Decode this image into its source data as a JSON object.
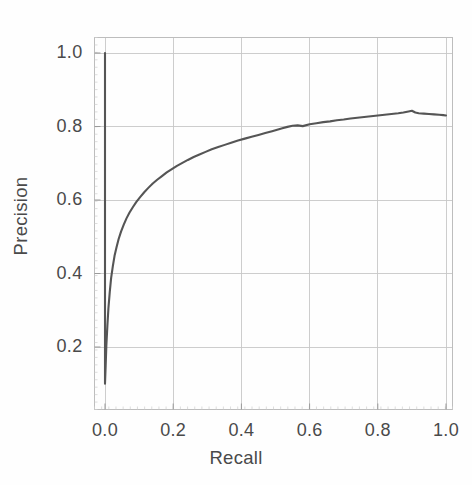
{
  "chart_data": {
    "type": "line",
    "title": "",
    "xlabel": "Recall",
    "ylabel": "Precision",
    "xlim": [
      0.0,
      1.0
    ],
    "ylim": [
      0.0,
      1.08
    ],
    "grid": true,
    "legend": null,
    "line_color": "#555555",
    "background_color": "#ffffff",
    "grid_color": "#c8c8c8",
    "frame_color": "#bdbdbd",
    "text_color": "#4a4a4a",
    "xticks": [
      "0.0",
      "0.2",
      "0.4",
      "0.6",
      "0.8",
      "1.0"
    ],
    "xtick_values": [
      0.0,
      0.2,
      0.4,
      0.6,
      0.8,
      1.0
    ],
    "yticks": [
      "0.2",
      "0.4",
      "0.6",
      "0.8",
      "1.0"
    ],
    "ytick_values": [
      0.2,
      0.4,
      0.6,
      0.8,
      1.0
    ],
    "series": [
      {
        "name": "precision-recall",
        "x": [
          0.0,
          0.0,
          0.0,
          0.002,
          0.004,
          0.007,
          0.01,
          0.014,
          0.018,
          0.023,
          0.028,
          0.034,
          0.04,
          0.047,
          0.055,
          0.063,
          0.072,
          0.082,
          0.092,
          0.103,
          0.115,
          0.127,
          0.14,
          0.153,
          0.167,
          0.181,
          0.196,
          0.211,
          0.227,
          0.243,
          0.26,
          0.277,
          0.295,
          0.313,
          0.332,
          0.351,
          0.37,
          0.39,
          0.41,
          0.43,
          0.45,
          0.47,
          0.49,
          0.505,
          0.52,
          0.535,
          0.55,
          0.565,
          0.58,
          0.6,
          0.62,
          0.64,
          0.66,
          0.68,
          0.7,
          0.72,
          0.74,
          0.76,
          0.78,
          0.8,
          0.82,
          0.84,
          0.86,
          0.875,
          0.89,
          0.9,
          0.91,
          0.92,
          0.935,
          0.95,
          0.965,
          0.98,
          0.992,
          1.0
        ],
        "y": [
          1.0,
          0.56,
          0.1,
          0.15,
          0.205,
          0.258,
          0.305,
          0.35,
          0.388,
          0.42,
          0.448,
          0.472,
          0.494,
          0.514,
          0.533,
          0.55,
          0.566,
          0.581,
          0.595,
          0.608,
          0.621,
          0.633,
          0.645,
          0.655,
          0.665,
          0.675,
          0.684,
          0.693,
          0.701,
          0.709,
          0.717,
          0.724,
          0.731,
          0.738,
          0.744,
          0.75,
          0.756,
          0.762,
          0.767,
          0.772,
          0.777,
          0.782,
          0.787,
          0.791,
          0.795,
          0.799,
          0.802,
          0.803,
          0.801,
          0.806,
          0.809,
          0.812,
          0.814,
          0.817,
          0.819,
          0.822,
          0.824,
          0.826,
          0.828,
          0.83,
          0.832,
          0.834,
          0.836,
          0.838,
          0.841,
          0.843,
          0.838,
          0.836,
          0.835,
          0.834,
          0.833,
          0.832,
          0.831,
          0.83
        ]
      }
    ],
    "annotations": [
      {
        "text": "vertical drop at recall 0 from precision 1.0 to 0.10",
        "x": 0.0,
        "y": 0.55
      }
    ]
  },
  "axes": {
    "x_title": "Recall",
    "y_title": "Precision"
  }
}
